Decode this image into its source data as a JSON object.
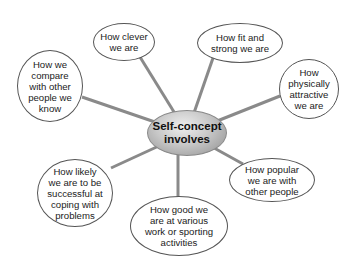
{
  "diagram": {
    "type": "mind-map",
    "center": {
      "label": "Self-concept\ninvolves",
      "fill": "#b0b0b0"
    },
    "connector_color": "#8a8a8a",
    "nodes": [
      {
        "id": "clever",
        "label": "How clever\nwe are",
        "cx": 124,
        "cy": 42,
        "rx": 31,
        "ry": 19
      },
      {
        "id": "fit",
        "label": "How fit and\nstrong we are",
        "cx": 240,
        "cy": 43,
        "rx": 43,
        "ry": 20
      },
      {
        "id": "attractive",
        "label": "How\nphysically\nattractive\nwe are",
        "cx": 309,
        "cy": 89,
        "rx": 30,
        "ry": 30
      },
      {
        "id": "compare",
        "label": "How we\ncompare\nwith other\npeople we\nknow",
        "cx": 50,
        "cy": 86,
        "rx": 33,
        "ry": 36
      },
      {
        "id": "coping",
        "label": "How likely\nwe are to be\nsuccessful at\ncoping with\nproblems",
        "cx": 75,
        "cy": 193,
        "rx": 38,
        "ry": 34
      },
      {
        "id": "popular",
        "label": "How popular\nwe are with\nother people",
        "cx": 272,
        "cy": 180,
        "rx": 43,
        "ry": 22
      },
      {
        "id": "work",
        "label": "How good we\nare at various\nwork or sporting\nactivities",
        "cx": 179,
        "cy": 226,
        "rx": 49,
        "ry": 30
      }
    ]
  }
}
